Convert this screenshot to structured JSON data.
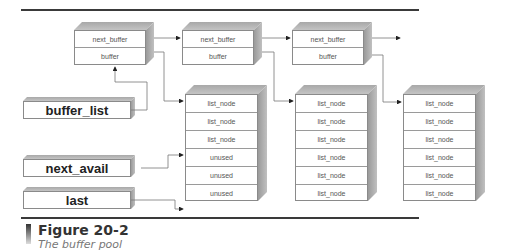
{
  "diagram": {
    "buffers": [
      {
        "fields": [
          "next_buffer",
          "buffer"
        ]
      },
      {
        "fields": [
          "next_buffer",
          "buffer"
        ]
      },
      {
        "fields": [
          "next_buffer",
          "buffer"
        ]
      }
    ],
    "node_columns": [
      {
        "cells": [
          "list_node",
          "list_node",
          "list_node",
          "unused",
          "unused",
          "unused"
        ]
      },
      {
        "cells": [
          "list_node",
          "list_node",
          "list_node",
          "list_node",
          "list_node",
          "list_node"
        ]
      },
      {
        "cells": [
          "list_node",
          "list_node",
          "list_node",
          "list_node",
          "list_node",
          "list_node"
        ]
      }
    ],
    "pointers": {
      "buffer_list": "buffer_list",
      "next_avail": "next_avail",
      "last": "last"
    }
  },
  "figure": {
    "number": "Figure 20-2",
    "caption": "The buffer pool"
  }
}
